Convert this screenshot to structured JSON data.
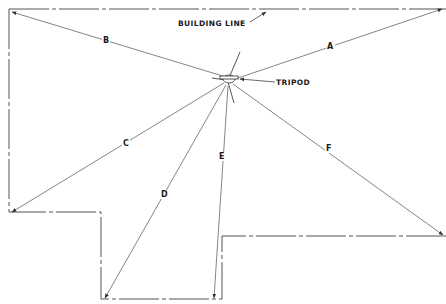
{
  "diagram": {
    "callouts": {
      "building_line": "BUILDING LINE",
      "tripod": "TRIPOD"
    },
    "measurement_lines": [
      {
        "id": "A",
        "label": "A"
      },
      {
        "id": "B",
        "label": "B"
      },
      {
        "id": "C",
        "label": "C"
      },
      {
        "id": "D",
        "label": "D"
      },
      {
        "id": "E",
        "label": "E"
      },
      {
        "id": "F",
        "label": "F"
      }
    ],
    "colors": {
      "line": "#555555",
      "text": "#1a1a1a",
      "background": "#ffffff"
    }
  }
}
